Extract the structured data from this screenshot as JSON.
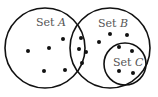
{
  "diagram": {
    "type": "venn",
    "sets": [
      {
        "id": "A",
        "label_prefix": "Set ",
        "label_var": "A",
        "cx": 45,
        "cy": 48,
        "r": 41
      },
      {
        "id": "B",
        "label_prefix": "Set ",
        "label_var": "B",
        "cx": 110,
        "cy": 48,
        "r": 41
      },
      {
        "id": "C",
        "label_prefix": "Set ",
        "label_var": "C",
        "cx": 125,
        "cy": 64,
        "r": 21
      }
    ],
    "regions": {
      "A_only": {
        "count": 5
      },
      "A_and_B": {
        "count": 4
      },
      "B_only": {
        "count": 3
      },
      "C": {
        "count": 4
      }
    },
    "stroke_color": "#111111",
    "dot_color": "#111111",
    "label_color": "#555555"
  }
}
